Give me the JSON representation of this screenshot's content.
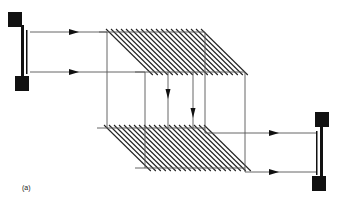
{
  "figure": {
    "label": "(a)",
    "colors": {
      "line": "#555555",
      "hatch": "#222222",
      "block": "#111111",
      "background": "#ffffff"
    },
    "left_element": {
      "top_block": {
        "x": 8,
        "y": 12,
        "w": 14,
        "h": 15
      },
      "bottom_block": {
        "x": 15,
        "y": 76,
        "w": 14,
        "h": 15
      },
      "thick_bar": {
        "x": 21,
        "y": 25,
        "w": 3,
        "h": 53
      },
      "thin_bar": {
        "x": 26,
        "y": 30,
        "w": 1.5,
        "h": 44
      }
    },
    "right_element": {
      "top_block": {
        "x": 315,
        "y": 112,
        "w": 14,
        "h": 15
      },
      "bottom_block": {
        "x": 312,
        "y": 176,
        "w": 14,
        "h": 15
      },
      "thick_bar": {
        "x": 320,
        "y": 125,
        "w": 3,
        "h": 53
      },
      "thin_bar": {
        "x": 316,
        "y": 131,
        "w": 1.5,
        "h": 44
      }
    },
    "upper_grating": {
      "top_y": 32,
      "bottom_y": 72,
      "top_x1": 107,
      "top_x2": 205,
      "bottom_x1": 145,
      "bottom_x2": 245
    },
    "lower_grating": {
      "top_y": 128,
      "bottom_y": 168,
      "top_x1": 105,
      "top_x2": 205,
      "bottom_x1": 145,
      "bottom_x2": 245
    },
    "input_rays": [
      {
        "y": 32,
        "x1": 30,
        "x2": 107,
        "arrow_x": 75
      },
      {
        "y": 72,
        "x1": 30,
        "x2": 145,
        "arrow_x": 75
      }
    ],
    "output_rays": [
      {
        "y": 133,
        "x1": 205,
        "x2": 317,
        "arrow_x": 275
      },
      {
        "y": 172,
        "x1": 245,
        "x2": 317,
        "arrow_x": 275
      }
    ],
    "vertical_lines": [
      {
        "x": 107,
        "y1": 32,
        "y2": 128
      },
      {
        "x": 145,
        "y1": 72,
        "y2": 168
      },
      {
        "x": 168,
        "y1": 72,
        "y2": 128,
        "arrow_y": 95
      },
      {
        "x": 193,
        "y1": 72,
        "y2": 128,
        "arrow_y": 114
      },
      {
        "x": 205,
        "y1": 32,
        "y2": 133
      },
      {
        "x": 245,
        "y1": 72,
        "y2": 172
      }
    ]
  }
}
